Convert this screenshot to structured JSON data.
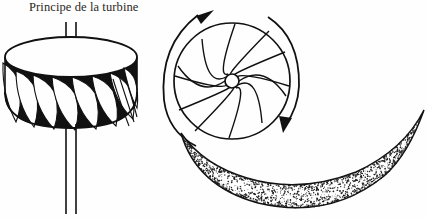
{
  "figure": {
    "title": "Principe de la turbine",
    "caption_language": "fr",
    "background_color": "#fefefe",
    "ink_color": "#1a1a1a",
    "title_color": "#2b2724"
  },
  "rotor_3d": {
    "name": "turbine rotor perspective view",
    "center_x": 71,
    "top_ellipse_cy": 57,
    "rx": 66,
    "ry": 20,
    "body_height": 64,
    "blade_count": 11,
    "blade_fill": "#111111",
    "shaft": {
      "top_from_y": 22,
      "top_to_y": 62,
      "bottom_from_y": 124,
      "bottom_to_y": 214,
      "half_width": 5
    }
  },
  "rotor_top": {
    "name": "turbine runner top view",
    "cx": 232,
    "cy": 81,
    "r": 58,
    "hub_r": 7,
    "blade_count": 12,
    "blade_curl": 0.55
  },
  "rotation_arrows": [
    {
      "label": "left rotation arc",
      "direction": "clockwise",
      "arrowhead": "up-right"
    },
    {
      "label": "right rotation arc",
      "direction": "clockwise",
      "arrowhead": "down-left"
    }
  ],
  "water_scoop": {
    "name": "stippled crescent water jet",
    "shading": "stipple",
    "dot_count": 1500,
    "dot_color": "#1c1c1c"
  }
}
